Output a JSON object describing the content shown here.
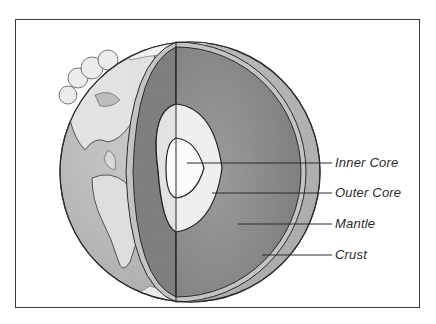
{
  "diagram": {
    "labels": [
      {
        "id": "inner-core",
        "text": "Inner Core",
        "y": 163
      },
      {
        "id": "outer-core",
        "text": "Outer Core",
        "y": 193
      },
      {
        "id": "mantle",
        "text": "Mantle",
        "y": 224
      },
      {
        "id": "crust",
        "text": "Crust",
        "y": 255
      }
    ],
    "colors": {
      "frame": "#3a3a3a",
      "ocean": "#b8b8b8",
      "land": "#e2e2e2",
      "cloud": "#ececec",
      "crust": "#c4c4c4",
      "mantle": "#8f8f8f",
      "mantle_dark": "#7a7a7a",
      "outer_core": "#efefef",
      "inner_core": "#fafafa",
      "lines": "#2a2a2a"
    }
  }
}
